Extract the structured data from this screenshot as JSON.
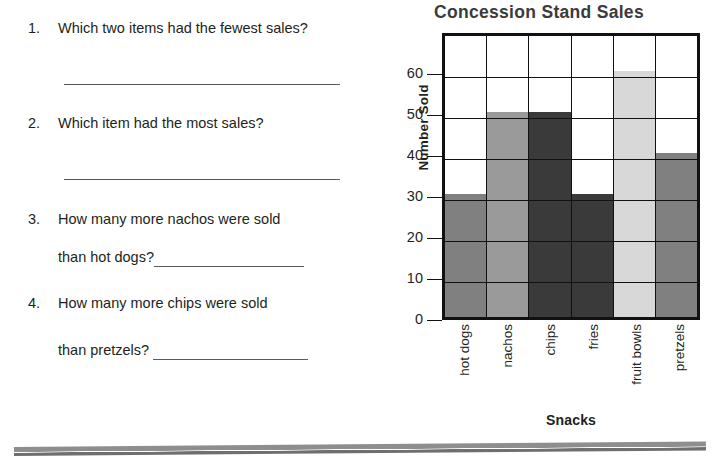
{
  "worksheet": {
    "questions": [
      {
        "number": "1.",
        "text": "Which two items had the fewest sales?",
        "answer_value": "",
        "line_style": "full"
      },
      {
        "number": "2.",
        "text": "Which item had the most sales?",
        "answer_value": "",
        "line_style": "full"
      },
      {
        "number": "3.",
        "text": "How many more nachos were sold",
        "text2": "than hot dogs?",
        "answer_value": "",
        "line_style": "inline"
      },
      {
        "number": "4.",
        "text": "How many more chips were sold",
        "text2": "than pretzels?",
        "answer_value": "",
        "line_style": "inline"
      }
    ]
  },
  "chart_data": {
    "type": "bar",
    "title": "Concession Stand Sales",
    "xlabel": "Snacks",
    "ylabel": "Number Sold",
    "categories": [
      "hot dogs",
      "nachos",
      "chips",
      "fries",
      "fruit bowls",
      "pretzels"
    ],
    "values": [
      30,
      50,
      50,
      30,
      60,
      40
    ],
    "colors": [
      "#808080",
      "#9a9a9a",
      "#3a3a3a",
      "#3a3a3a",
      "#d8d8d8",
      "#808080"
    ],
    "ylim": [
      0,
      70
    ],
    "yticks": [
      0,
      10,
      20,
      30,
      40,
      50,
      60
    ],
    "ytick_labels": [
      "0",
      "10",
      "20",
      "30",
      "40",
      "50",
      "60"
    ],
    "grid": true,
    "legend": "none"
  },
  "style": {
    "frame_color": "#111111",
    "text_color": "#231f20",
    "title_color": "#3b3b3b",
    "rule_color": "#8e8e8e"
  }
}
